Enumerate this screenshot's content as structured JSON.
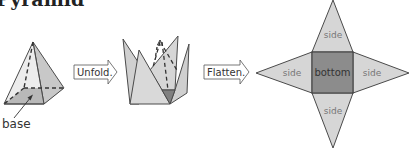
{
  "title": "Pyramid",
  "colors": {
    "face_light": "#d6d6d6",
    "face_dark": "#8c8c8c",
    "stroke": "#4a4a4a",
    "label_text": "#777777",
    "arrow_fill": "#ffffff"
  },
  "figures": {
    "solid": {
      "label": "base"
    },
    "unfold_arrow": {
      "label": "Unfold."
    },
    "flatten_arrow": {
      "label": "Flatten."
    },
    "net": {
      "center_label": "bottom",
      "side_labels": [
        "side",
        "side",
        "side",
        "side"
      ]
    }
  }
}
